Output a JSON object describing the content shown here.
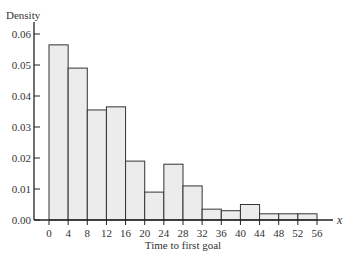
{
  "chart_data": {
    "type": "bar",
    "subtype": "histogram",
    "title": "",
    "xlabel": "Time to first goal",
    "ylabel": "Density",
    "x_variable": "x",
    "bin_edges": [
      0,
      4,
      8,
      12,
      16,
      20,
      24,
      28,
      32,
      36,
      40,
      44,
      48,
      52,
      56
    ],
    "categories": [
      "0-4",
      "4-8",
      "8-12",
      "12-16",
      "16-20",
      "20-24",
      "24-28",
      "28-32",
      "32-36",
      "36-40",
      "40-44",
      "44-48",
      "48-52",
      "52-56"
    ],
    "values": [
      0.0565,
      0.049,
      0.0355,
      0.0365,
      0.019,
      0.009,
      0.018,
      0.011,
      0.0035,
      0.003,
      0.005,
      0.002,
      0.002,
      0.002
    ],
    "x_ticks": [
      "0",
      "4",
      "8",
      "12",
      "16",
      "20",
      "24",
      "28",
      "32",
      "36",
      "40",
      "44",
      "48",
      "52",
      "56"
    ],
    "y_ticks": [
      "0.00",
      "0.01",
      "0.02",
      "0.03",
      "0.04",
      "0.05",
      "0.06"
    ],
    "ylim": [
      0,
      0.065
    ],
    "xlim": [
      0,
      56
    ],
    "grid": false,
    "legend": null,
    "colors": {
      "bar_fill": "#ececec",
      "bar_stroke": "#333333",
      "axis": "#222222"
    }
  }
}
